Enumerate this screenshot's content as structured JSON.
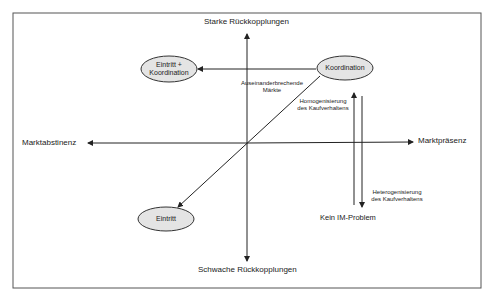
{
  "diagram": {
    "axes": {
      "top": "Starke Rückkopplungen",
      "bottom": "Schwache Rückkopplungen",
      "left": "Marktabstinenz",
      "right": "Marktpräsenz"
    },
    "nodes": {
      "entry_coord": "Eintritt + Koordination",
      "entry_coord_l1": "Eintritt +",
      "entry_coord_l2": "Koordination",
      "coordination": "Koordination",
      "entry": "Eintritt"
    },
    "annotations": {
      "breaking_l1": "Auseinanderbrechende",
      "breaking_l2": "Märkte",
      "homog_l1": "Homogenisierung",
      "homog_l2": "des Kaufverhaltens",
      "heterog_l1": "Heterogenisierung",
      "heterog_l2": "des Kaufverhaltens",
      "no_problem": "Kein IM-Problem"
    },
    "colors": {
      "ellipse_fill": "#e4e4e4",
      "line": "#222222"
    }
  }
}
